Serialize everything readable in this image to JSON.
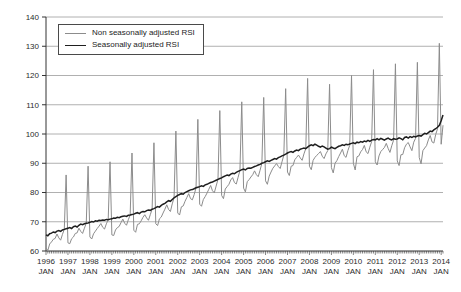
{
  "chart_data": {
    "type": "line",
    "title": "",
    "x_start": "1996 JAN",
    "x_end": "2014 FEB",
    "x_tick_years": [
      "1996",
      "1997",
      "1998",
      "1999",
      "2000",
      "2001",
      "2002",
      "2003",
      "2004",
      "2005",
      "2006",
      "2007",
      "2008",
      "2009",
      "2010",
      "2011",
      "2012",
      "2013",
      "2014"
    ],
    "x_tick_sub_label": "JAN",
    "y_ticks": [
      60,
      70,
      80,
      90,
      100,
      110,
      120,
      130,
      140
    ],
    "ylim": [
      60,
      140
    ],
    "grid": "horizontal",
    "legend_position": "top-left",
    "colors": {
      "grid": "#9c9c9c",
      "axis": "#333333"
    },
    "series": [
      {
        "name": "Non seasonally adjusted RSI",
        "color": "#8c8c8c",
        "width": 1,
        "values": [
          61.0,
          60.2,
          62.4,
          63.1,
          64.0,
          64.3,
          65.8,
          64.5,
          63.7,
          65.7,
          67.4,
          86.0,
          62.8,
          62.5,
          64.2,
          64.8,
          66.0,
          66.2,
          67.8,
          66.7,
          66.0,
          67.8,
          69.5,
          89.0,
          64.8,
          64.1,
          65.9,
          66.8,
          67.7,
          68.5,
          69.4,
          68.1,
          67.5,
          69.3,
          70.7,
          90.5,
          65.5,
          65.3,
          67.2,
          68.0,
          68.4,
          69.7,
          70.9,
          69.5,
          68.8,
          70.7,
          72.3,
          93.5,
          67.1,
          66.4,
          69.1,
          69.3,
          70.3,
          71.5,
          72.4,
          71.3,
          70.5,
          72.4,
          74.3,
          97.0,
          69.3,
          68.7,
          71.0,
          71.6,
          73.0,
          74.3,
          75.8,
          74.2,
          73.5,
          76.1,
          78.2,
          101.0,
          73.0,
          72.3,
          75.1,
          75.4,
          77.0,
          78.3,
          79.6,
          77.9,
          77.5,
          79.3,
          81.6,
          105.0,
          76.0,
          75.3,
          77.6,
          78.6,
          79.8,
          81.1,
          82.4,
          80.6,
          79.9,
          82.2,
          84.5,
          108.0,
          79.0,
          77.9,
          81.2,
          82.0,
          82.8,
          84.3,
          85.1,
          83.4,
          82.9,
          85.2,
          87.5,
          111.0,
          81.5,
          80.2,
          83.7,
          84.4,
          85.3,
          86.1,
          87.4,
          86.1,
          85.4,
          87.6,
          90.0,
          112.5,
          84.0,
          82.8,
          85.6,
          87.0,
          88.3,
          89.1,
          89.9,
          88.9,
          88.2,
          90.5,
          92.8,
          115.5,
          87.0,
          85.8,
          89.0,
          89.2,
          91.2,
          92.0,
          92.8,
          91.8,
          91.0,
          93.2,
          95.0,
          119.0,
          89.0,
          87.8,
          91.0,
          92.0,
          92.7,
          93.3,
          94.0,
          92.4,
          91.6,
          93.2,
          94.3,
          117.0,
          88.5,
          86.7,
          90.0,
          90.9,
          92.3,
          93.5,
          94.8,
          92.6,
          92.0,
          94.3,
          96.1,
          120.0,
          90.0,
          87.7,
          92.2,
          92.5,
          93.9,
          94.7,
          96.1,
          93.9,
          93.3,
          95.5,
          97.4,
          122.0,
          90.5,
          89.4,
          92.5,
          94.0,
          94.7,
          95.4,
          96.8,
          95.1,
          93.7,
          96.0,
          97.9,
          124.0,
          90.8,
          89.2,
          92.9,
          93.0,
          95.3,
          96.5,
          97.1,
          95.6,
          94.3,
          97.2,
          98.5,
          124.5,
          92.0,
          89.8,
          94.3,
          95.2,
          96.0,
          98.0,
          99.5,
          97.3,
          96.9,
          99.8,
          101.8,
          131.0,
          96.5,
          103.0
        ]
      },
      {
        "name": "Seasonally adjusted RSI",
        "color": "#1f1f1f",
        "width": 1.5,
        "values": [
          65.5,
          65.2,
          65.9,
          66.1,
          66.5,
          66.3,
          66.8,
          67.0,
          66.7,
          67.2,
          67.4,
          67.6,
          67.8,
          68.0,
          67.7,
          68.3,
          68.5,
          68.2,
          68.8,
          69.2,
          69.0,
          69.3,
          69.5,
          69.6,
          69.8,
          70.1,
          69.9,
          70.3,
          70.2,
          70.5,
          70.4,
          70.6,
          70.5,
          70.8,
          70.7,
          70.9,
          71.0,
          71.3,
          71.2,
          71.5,
          71.4,
          71.7,
          71.9,
          72.0,
          71.8,
          72.2,
          72.3,
          72.5,
          72.6,
          72.9,
          73.1,
          72.8,
          73.3,
          73.5,
          73.4,
          73.8,
          74.0,
          73.9,
          74.3,
          74.5,
          74.8,
          75.2,
          75.0,
          75.6,
          76.0,
          76.3,
          76.8,
          77.2,
          77.0,
          77.6,
          78.2,
          78.6,
          79.0,
          79.3,
          79.6,
          79.4,
          80.0,
          80.3,
          80.6,
          80.9,
          81.0,
          81.3,
          81.6,
          81.8,
          82.0,
          82.3,
          82.1,
          82.6,
          82.8,
          83.1,
          83.4,
          83.6,
          83.9,
          84.2,
          84.5,
          84.8,
          85.0,
          85.4,
          85.7,
          86.0,
          85.8,
          86.3,
          86.6,
          86.4,
          86.9,
          87.2,
          87.5,
          87.8,
          88.0,
          87.7,
          88.2,
          88.4,
          88.3,
          88.6,
          88.9,
          89.1,
          89.4,
          89.6,
          90.0,
          90.2,
          90.5,
          90.8,
          90.6,
          91.0,
          91.3,
          91.6,
          91.4,
          91.9,
          92.2,
          92.5,
          92.8,
          93.1,
          93.5,
          93.8,
          94.0,
          93.7,
          94.2,
          94.5,
          94.3,
          94.8,
          95.0,
          95.2,
          95.0,
          95.5,
          96.0,
          96.3,
          96.0,
          96.5,
          96.2,
          95.8,
          95.5,
          95.9,
          95.6,
          95.2,
          94.8,
          95.0,
          95.5,
          95.2,
          95.0,
          95.4,
          95.8,
          96.0,
          96.3,
          96.1,
          96.5,
          96.3,
          96.6,
          96.8,
          97.0,
          96.7,
          97.2,
          97.0,
          97.4,
          97.2,
          97.6,
          97.4,
          97.8,
          97.5,
          97.9,
          98.1,
          98.0,
          98.4,
          98.0,
          98.5,
          98.2,
          97.9,
          98.3,
          98.6,
          98.2,
          98.0,
          98.4,
          98.2,
          98.3,
          98.7,
          98.4,
          98.0,
          98.8,
          99.0,
          98.6,
          99.1,
          98.8,
          99.2,
          99.0,
          99.3,
          99.5,
          99.3,
          99.8,
          100.2,
          100.0,
          100.5,
          101.0,
          100.8,
          101.4,
          101.8,
          102.3,
          103.0,
          104.5,
          106.5
        ]
      }
    ]
  }
}
